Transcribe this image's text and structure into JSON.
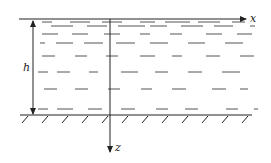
{
  "diagram": {
    "type": "fluid-layer-schematic",
    "labels": {
      "x_axis": "x",
      "z_axis": "z",
      "depth": "h"
    },
    "colors": {
      "line": "#222222",
      "dash": "#555555",
      "background": "#ffffff"
    },
    "surface": {
      "y": 19,
      "x1": 19,
      "x2": 246
    },
    "bottom": {
      "y": 115,
      "x1": 20,
      "x2": 252
    },
    "z_axis": {
      "x": 110,
      "y1": 19,
      "y2": 152
    },
    "depth_arrow": {
      "x": 33,
      "y1": 21,
      "y2": 114
    },
    "hatch_xs": [
      23,
      43,
      63,
      83,
      103,
      123,
      143,
      163,
      183,
      203,
      223,
      243
    ],
    "dash_rows": [
      {
        "y": 22,
        "segments": [
          [
            42,
            52
          ],
          [
            70,
            90
          ],
          [
            102,
            122
          ],
          [
            140,
            155
          ],
          [
            165,
            190
          ],
          [
            198,
            220
          ],
          [
            232,
            245
          ]
        ]
      },
      {
        "y": 26,
        "segments": [
          [
            51,
            73
          ],
          [
            87,
            107
          ],
          [
            118,
            145
          ],
          [
            150,
            167
          ],
          [
            181,
            203
          ],
          [
            214,
            233
          ],
          [
            250,
            255
          ]
        ]
      },
      {
        "y": 34,
        "segments": [
          [
            42,
            58
          ],
          [
            72,
            88
          ],
          [
            104,
            120
          ],
          [
            140,
            150
          ],
          [
            170,
            182
          ],
          [
            206,
            222
          ],
          [
            237,
            252
          ]
        ]
      },
      {
        "y": 43,
        "segments": [
          [
            40,
            45
          ],
          [
            56,
            73
          ],
          [
            84,
            103
          ],
          [
            116,
            135
          ],
          [
            150,
            168
          ],
          [
            188,
            205
          ],
          [
            225,
            243
          ]
        ]
      },
      {
        "y": 56,
        "segments": [
          [
            42,
            55
          ],
          [
            75,
            87
          ],
          [
            106,
            118
          ],
          [
            140,
            155
          ],
          [
            172,
            182
          ],
          [
            206,
            220
          ],
          [
            240,
            254
          ]
        ]
      },
      {
        "y": 72,
        "segments": [
          [
            38,
            48
          ],
          [
            57,
            70
          ],
          [
            89,
            98
          ],
          [
            121,
            138
          ],
          [
            155,
            168
          ],
          [
            188,
            202
          ],
          [
            222,
            240
          ]
        ]
      },
      {
        "y": 89,
        "segments": [
          [
            44,
            57
          ],
          [
            75,
            88
          ],
          [
            108,
            120
          ],
          [
            141,
            152
          ],
          [
            172,
            186
          ],
          [
            212,
            226
          ],
          [
            240,
            248
          ]
        ]
      },
      {
        "y": 109,
        "segments": [
          [
            38,
            48
          ],
          [
            57,
            73
          ],
          [
            88,
            102
          ],
          [
            121,
            135
          ],
          [
            156,
            168
          ],
          [
            185,
            198
          ],
          [
            226,
            238
          ],
          [
            254,
            258
          ]
        ]
      }
    ]
  }
}
